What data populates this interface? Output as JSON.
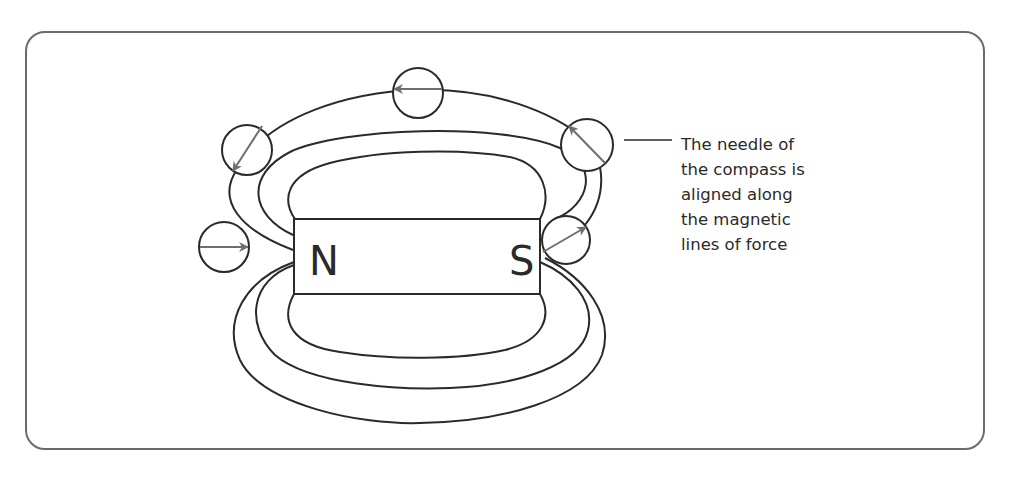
{
  "diagram": {
    "magnet": {
      "north_label": "N",
      "south_label": "S"
    },
    "caption": {
      "lines": [
        "The needle of",
        "the compass is",
        "aligned along",
        "the magnetic",
        "lines of force"
      ]
    },
    "compasses": [
      {
        "position": "left",
        "needle_direction": "right"
      },
      {
        "position": "upper-left",
        "needle_direction": "down-left"
      },
      {
        "position": "top",
        "needle_direction": "left"
      },
      {
        "position": "upper-right",
        "needle_direction": "up-left"
      },
      {
        "position": "right",
        "needle_direction": "up-right"
      }
    ],
    "colors": {
      "line": "#2a2a2a",
      "needle": "#6e6e6e",
      "frame": "#6b6b6b"
    }
  }
}
